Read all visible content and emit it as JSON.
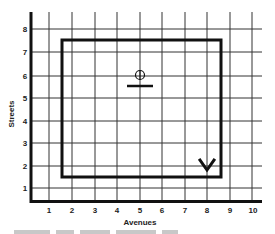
{
  "diagram": {
    "type": "street-grid-route",
    "x_axis": {
      "label": "Avenues",
      "ticks": [
        "1",
        "2",
        "3",
        "4",
        "5",
        "6",
        "7",
        "8",
        "9",
        "10"
      ]
    },
    "y_axis": {
      "label": "Streets",
      "ticks": [
        "1",
        "2",
        "3",
        "4",
        "5",
        "6",
        "7",
        "8"
      ]
    },
    "route": {
      "shape": "rectangle",
      "from_avenue": 1.5,
      "to_avenue": 8.5,
      "from_street": 1.5,
      "to_street": 7.5
    },
    "markers": [
      {
        "name": "start-marker",
        "shape": "circle-with-cross-over-bar",
        "avenue": 5,
        "street": 5.6
      },
      {
        "name": "check-marker",
        "shape": "v-mark",
        "avenue": 8,
        "street": 1.8
      }
    ],
    "colors": {
      "line": "#111111",
      "grid": "#333333",
      "background": "#ffffff"
    }
  }
}
